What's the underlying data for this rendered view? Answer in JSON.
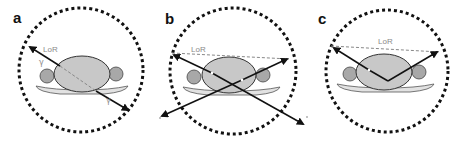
{
  "figure": {
    "colors": {
      "ring": "#111111",
      "body_fill": "#c8c8c8",
      "body_stroke": "#333333",
      "arm_fill": "#a8a8a8",
      "bed_fill": "#e2e2e2",
      "arrow": "#111111",
      "lor_line": "#8a8a8a",
      "text_gray": "#8a8a8a"
    },
    "panels": [
      {
        "label": "a",
        "lor_label": "LoR",
        "gamma_label_1": "γ",
        "gamma_label_2": "γ",
        "type": "true coincidence"
      },
      {
        "label": "b",
        "lor_label": "LoR",
        "type": "random coincidence"
      },
      {
        "label": "c",
        "lor_label": "LoR",
        "type": "scattered coincidence"
      }
    ]
  }
}
